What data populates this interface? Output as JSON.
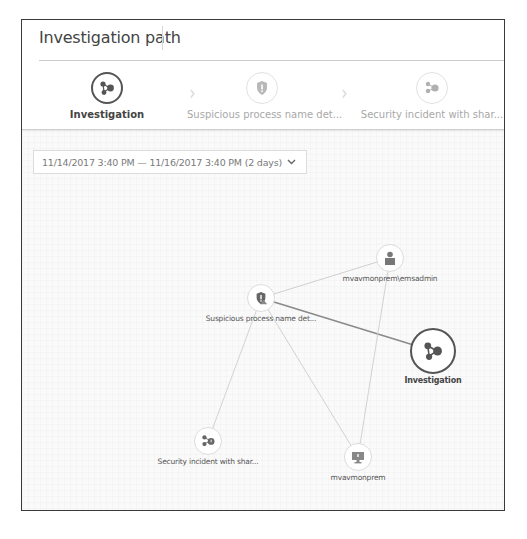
{
  "header": {
    "title": "Investigation path"
  },
  "steps": [
    {
      "label": "Investigation",
      "icon": "investigation-graph-icon",
      "state": "active"
    },
    {
      "label": "Suspicious process name det...",
      "icon": "shield-alert-icon",
      "state": "inactive"
    },
    {
      "label": "Security incident with shar...",
      "icon": "incident-graph-icon",
      "state": "inactive"
    }
  ],
  "step_separator": "›",
  "date_range": {
    "value": "11/14/2017 3:40 PM — 11/16/2017 3:40 PM (2 days)",
    "chevron": "⌄"
  },
  "graph": {
    "nodes": [
      {
        "id": "suspicious",
        "label": "Suspicious process name det...",
        "icon": "shield-alert-icon"
      },
      {
        "id": "emsadmin",
        "label": "mvavmonprem\\emsadmin",
        "icon": "user-icon"
      },
      {
        "id": "investigation",
        "label": "Investigation",
        "icon": "investigation-graph-icon"
      },
      {
        "id": "incident",
        "label": "Security incident with shar...",
        "icon": "incident-graph-icon"
      },
      {
        "id": "host",
        "label": "mvavmonprem",
        "icon": "computer-icon"
      }
    ],
    "edges": [
      {
        "from": "suspicious",
        "to": "emsadmin"
      },
      {
        "from": "suspicious",
        "to": "investigation",
        "emphasis": true
      },
      {
        "from": "suspicious",
        "to": "incident"
      },
      {
        "from": "suspicious",
        "to": "host"
      },
      {
        "from": "emsadmin",
        "to": "host"
      }
    ]
  },
  "colors": {
    "active": "#555555",
    "inactive_text": "#a8a8a8",
    "edge": "#d0d0d0",
    "edge_emphasis": "#8a8a8a",
    "icon": "#666666"
  }
}
